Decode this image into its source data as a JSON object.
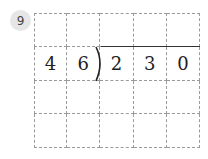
{
  "problem": {
    "number": "9",
    "grid": {
      "rows": 4,
      "cols": 5,
      "cells": [
        [
          "",
          "",
          "",
          "",
          ""
        ],
        [
          "4",
          "6",
          "2",
          "3",
          "0"
        ],
        [
          "",
          "",
          "",
          "",
          ""
        ],
        [
          "",
          "",
          "",
          "",
          ""
        ]
      ]
    },
    "divisor": "46",
    "dividend": "230"
  }
}
